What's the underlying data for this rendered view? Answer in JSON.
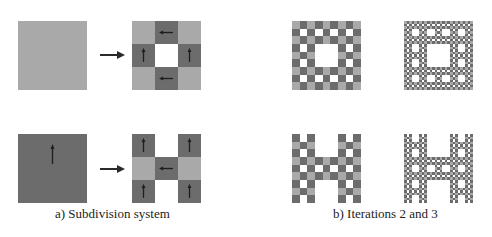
{
  "colors": {
    "light": "#a9a9a9",
    "dark": "#6c6c6c",
    "empty": "#ffffff",
    "arrow": "#1e1e1e",
    "connector": "#2a2a2a"
  },
  "rules": {
    "A": [
      [
        {
          "t": "A"
        },
        {
          "t": "B",
          "dir": "left"
        },
        {
          "t": "A"
        }
      ],
      [
        {
          "t": "B",
          "dir": "up"
        },
        null,
        {
          "t": "B",
          "dir": "up"
        }
      ],
      [
        {
          "t": "A"
        },
        {
          "t": "B",
          "dir": "left"
        },
        {
          "t": "A"
        }
      ]
    ],
    "B": [
      [
        {
          "t": "B",
          "dir": "up"
        },
        null,
        {
          "t": "B",
          "dir": "up"
        }
      ],
      [
        {
          "t": "A"
        },
        {
          "t": "B",
          "dir": "left"
        },
        {
          "t": "A"
        }
      ],
      [
        {
          "t": "B",
          "dir": "up"
        },
        null,
        {
          "t": "B",
          "dir": "up"
        }
      ]
    ]
  },
  "panel_a": {
    "caption": "a) Subdivision system",
    "rows": [
      {
        "source": {
          "t": "A"
        },
        "label": "light-square-rule"
      },
      {
        "source": {
          "t": "B",
          "dir": "up"
        },
        "label": "dark-square-rule"
      }
    ]
  },
  "panel_b": {
    "caption": "b) Iterations 2 and 3",
    "iterations": [
      2,
      3
    ]
  }
}
